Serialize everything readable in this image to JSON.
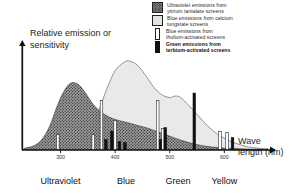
{
  "chart_data": {
    "type": "area",
    "title": "",
    "xlabel": "Wave length (nm)",
    "ylabel": "Relative emission or sensitivity",
    "xlim": [
      230,
      680
    ],
    "ylim": [
      0,
      1.05
    ],
    "xticks": [
      300,
      400,
      500,
      600
    ],
    "xtick_labels": [
      "300",
      "400",
      "500",
      "600"
    ],
    "grid": false,
    "legend_position": "top-right",
    "bands": [
      {
        "label": "Ultraviolet",
        "center": 300
      },
      {
        "label": "Blue",
        "center": 420
      },
      {
        "label": "Green",
        "center": 515
      },
      {
        "label": "Yellow",
        "center": 600
      }
    ],
    "series": [
      {
        "name": "Ultraviolet emissions from yttrium tantalate screens",
        "type": "area",
        "fill": "stipple-dark",
        "color": "#6e6e6e",
        "x": [
          235,
          250,
          265,
          280,
          295,
          305,
          315,
          325,
          335,
          345,
          360,
          375,
          390,
          405,
          420,
          440,
          460,
          480,
          500,
          520,
          545,
          570,
          600,
          640,
          680
        ],
        "y": [
          0.02,
          0.04,
          0.1,
          0.24,
          0.46,
          0.58,
          0.66,
          0.68,
          0.65,
          0.58,
          0.46,
          0.38,
          0.33,
          0.3,
          0.28,
          0.25,
          0.22,
          0.18,
          0.14,
          0.1,
          0.06,
          0.035,
          0.02,
          0.01,
          0.005
        ]
      },
      {
        "name": "Blue emissions from calcium tungstate screens",
        "type": "area",
        "fill": "light-gray",
        "color": "#e8e8e8",
        "x": [
          300,
          320,
          340,
          355,
          370,
          385,
          400,
          415,
          425,
          440,
          455,
          470,
          485,
          500,
          510,
          520,
          535,
          550,
          570,
          590,
          615,
          645,
          680
        ],
        "y": [
          0.02,
          0.05,
          0.12,
          0.22,
          0.4,
          0.62,
          0.8,
          0.88,
          0.9,
          0.86,
          0.76,
          0.64,
          0.56,
          0.53,
          0.545,
          0.53,
          0.45,
          0.36,
          0.24,
          0.15,
          0.08,
          0.03,
          0.01
        ]
      }
    ],
    "lines": [
      {
        "name": "Blue emissions from thulium-activated screens",
        "style": "white-bar",
        "points": [
          {
            "x": 295,
            "y": 0.155
          },
          {
            "x": 360,
            "y": 0.155
          },
          {
            "x": 375,
            "y": 0.5
          },
          {
            "x": 400,
            "y": 0.295
          },
          {
            "x": 478,
            "y": 0.5
          },
          {
            "x": 487,
            "y": 0.215
          },
          {
            "x": 592,
            "y": 0.185
          },
          {
            "x": 605,
            "y": 0.175
          }
        ]
      },
      {
        "name": "Green emissions from terbium-activated screens",
        "style": "black-bar",
        "points": [
          {
            "x": 383,
            "y": 0.105
          },
          {
            "x": 394,
            "y": 0.19
          },
          {
            "x": 408,
            "y": 0.085
          },
          {
            "x": 418,
            "y": 0.075
          },
          {
            "x": 483,
            "y": 0.105
          },
          {
            "x": 492,
            "y": 0.225
          },
          {
            "x": 545,
            "y": 0.575
          },
          {
            "x": 615,
            "y": 0.125
          }
        ]
      }
    ]
  },
  "legend": {
    "items": [
      {
        "swatch": "stipple-dark",
        "line1": "Ultraviolet emissions from",
        "line2": "yttrium tantalate screens",
        "bold": false
      },
      {
        "swatch": "light-gray",
        "line1": "Blue emissions from calcium",
        "line2": "tungstate screens",
        "bold": false
      },
      {
        "swatch": "white-bar",
        "line1": "Blue emissions from",
        "line2": "thulium-activated screens",
        "bold": false
      },
      {
        "swatch": "black-bar",
        "line1": "Green emissions from",
        "line2": "terbium-activated screens",
        "bold": true
      }
    ]
  }
}
